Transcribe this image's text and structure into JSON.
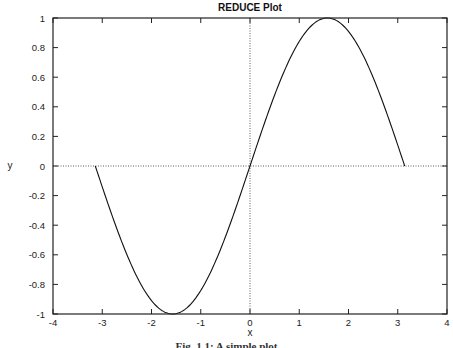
{
  "chart_data": {
    "type": "line",
    "title": "REDUCE Plot",
    "xlabel": "x",
    "ylabel": "y",
    "xlim": [
      -4,
      4
    ],
    "ylim": [
      -1,
      1
    ],
    "x_ticks": [
      -4,
      -3,
      -2,
      -1,
      0,
      1,
      2,
      3,
      4
    ],
    "y_ticks": [
      -1,
      -0.8,
      -0.6,
      -0.4,
      -0.2,
      0,
      0.2,
      0.4,
      0.6,
      0.8,
      1
    ],
    "x_tick_labels": [
      "-4",
      "-3",
      "-2",
      "-1",
      "0",
      "1",
      "2",
      "3",
      "4"
    ],
    "y_tick_labels": [
      "-1",
      "-0.8",
      "-0.6",
      "-0.4",
      "-0.2",
      "0",
      "0.2",
      "0.4",
      "0.6",
      "0.8",
      "1"
    ],
    "grid": false,
    "zero_lines": {
      "x0": true,
      "y0": true,
      "style": "dotted"
    },
    "legend": null,
    "series": [
      {
        "name": "sin(x)",
        "x": [
          -3.1416,
          -2.7489,
          -2.3562,
          -1.9635,
          -1.5708,
          -1.1781,
          -0.7854,
          -0.3927,
          0,
          0.3927,
          0.7854,
          1.1781,
          1.5708,
          1.9635,
          2.3562,
          2.7489,
          3.1416
        ],
        "y": [
          0,
          -0.3827,
          -0.7071,
          -0.9239,
          -1,
          -0.9239,
          -0.7071,
          -0.3827,
          0,
          0.3827,
          0.7071,
          0.9239,
          1,
          0.9239,
          0.7071,
          0.3827,
          0
        ]
      }
    ]
  },
  "caption": "Fig. 1.1: A simple plot"
}
